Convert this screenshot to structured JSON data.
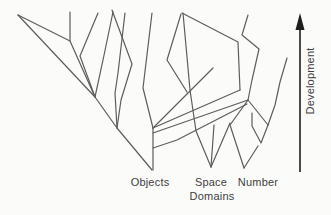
{
  "figure": {
    "background": "#fbfbf9",
    "line_color": "#5d5d5d",
    "text_color": "#3e3e3e",
    "labels": {
      "objects": "Objects",
      "space": "Space",
      "number": "Number",
      "domains": "Domains",
      "development": "Development"
    },
    "arrow": {
      "x": 300,
      "y_top": 13,
      "y_bottom": 172,
      "head_length": 17,
      "head_half_width": 4.5,
      "color": "#1e1e1e"
    },
    "branches": [
      [
        [
          18,
          15
        ],
        [
          70,
          41
        ]
      ],
      [
        [
          70,
          12
        ],
        [
          70,
          41
        ],
        [
          95,
          97
        ]
      ],
      [
        [
          98,
          13
        ],
        [
          80,
          56
        ],
        [
          95,
          97
        ]
      ],
      [
        [
          18,
          15
        ],
        [
          95,
          97
        ],
        [
          117,
          128
        ],
        [
          152,
          170
        ]
      ],
      [
        [
          113,
          12
        ],
        [
          103,
          60
        ],
        [
          95,
          97
        ]
      ],
      [
        [
          125,
          13
        ],
        [
          118,
          73
        ],
        [
          115,
          93
        ],
        [
          117,
          128
        ]
      ],
      [
        [
          112,
          10
        ],
        [
          132,
          64
        ],
        [
          121,
          100
        ],
        [
          117,
          128
        ]
      ],
      [
        [
          152,
          13
        ],
        [
          143,
          88
        ],
        [
          153,
          128
        ]
      ],
      [
        [
          153,
          128
        ],
        [
          153,
          170
        ]
      ],
      [
        [
          153,
          128
        ],
        [
          213,
          68
        ]
      ],
      [
        [
          181,
          14
        ],
        [
          167,
          60
        ],
        [
          187,
          92
        ]
      ],
      [
        [
          182,
          13
        ],
        [
          238,
          42
        ],
        [
          240,
          90
        ]
      ],
      [
        [
          240,
          90
        ],
        [
          153,
          128
        ]
      ],
      [
        [
          183,
          13
        ],
        [
          190,
          90
        ],
        [
          196,
          131
        ],
        [
          211,
          167
        ]
      ],
      [
        [
          153,
          133
        ],
        [
          248,
          100
        ]
      ],
      [
        [
          153,
          148
        ],
        [
          177,
          140
        ],
        [
          247,
          104
        ]
      ],
      [
        [
          211,
          167
        ],
        [
          214,
          125
        ]
      ],
      [
        [
          211,
          167
        ],
        [
          230,
          123
        ]
      ],
      [
        [
          248,
          15
        ],
        [
          242,
          35
        ],
        [
          259,
          49
        ],
        [
          252,
          80
        ],
        [
          248,
          100
        ]
      ],
      [
        [
          248,
          100
        ],
        [
          230,
          125
        ],
        [
          244,
          168
        ]
      ],
      [
        [
          248,
          100
        ],
        [
          268,
          125
        ]
      ],
      [
        [
          252,
          113
        ],
        [
          252,
          126
        ],
        [
          261,
          143
        ],
        [
          268,
          125
        ]
      ],
      [
        [
          244,
          168
        ],
        [
          258,
          146
        ]
      ],
      [
        [
          268,
          125
        ],
        [
          275,
          105
        ],
        [
          280,
          82
        ],
        [
          287,
          58
        ]
      ]
    ]
  }
}
